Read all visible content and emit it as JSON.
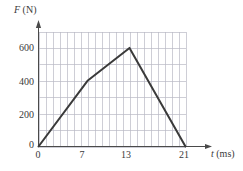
{
  "chart_data": {
    "type": "line",
    "title": "",
    "xlabel": "t (ms)",
    "ylabel": "F (N)",
    "xlabel_var": "t",
    "xlabel_unit": "(ms)",
    "ylabel_var": "F",
    "ylabel_unit": "(N)",
    "x": [
      0,
      7,
      13,
      21
    ],
    "values": [
      0,
      400,
      600,
      0
    ],
    "series": [
      {
        "name": "Force vs time",
        "points": [
          {
            "x": 0,
            "y": 0
          },
          {
            "x": 7,
            "y": 400
          },
          {
            "x": 13,
            "y": 600
          },
          {
            "x": 21,
            "y": 0
          }
        ]
      }
    ],
    "xlim": [
      0,
      21
    ],
    "ylim": [
      0,
      700
    ],
    "xticks": [
      0,
      7,
      13,
      21
    ],
    "yticks": [
      0,
      200,
      400,
      600
    ],
    "xtick_labels": [
      "0",
      "7",
      "13",
      "21"
    ],
    "ytick_labels": [
      "0",
      "200",
      "400",
      "600"
    ],
    "grid": true,
    "grid_x_step": 1,
    "grid_y_step": 100,
    "legend": "none",
    "line_color": "#3a3a3a",
    "grid_color": "#b9b9c4",
    "axis_color": "#4a4a4a"
  }
}
